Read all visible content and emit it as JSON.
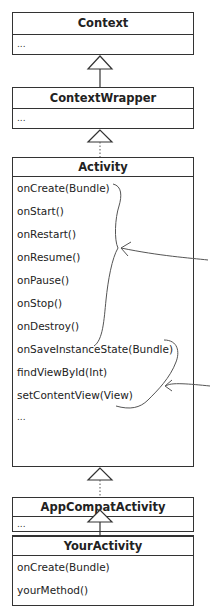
{
  "classes": [
    {
      "name": "Context",
      "members": [
        "..."
      ]
    },
    {
      "name": "ContextWrapper",
      "members": [
        "..."
      ]
    },
    {
      "name": "Activity",
      "members": [
        "onCreate(Bundle)",
        "onStart()",
        "onRestart()",
        "onResume()",
        "onPause()",
        "onStop()",
        "onDestroy()",
        "onSaveInstanceState(Bundle)",
        "findViewById(Int)",
        "setContentView(View)",
        "..."
      ]
    },
    {
      "name": "AppCompatActivity",
      "members": [
        "..."
      ]
    },
    {
      "name": "YourActivity",
      "members": [
        "onCreate(Bundle)",
        "yourMethod()"
      ]
    }
  ],
  "relations": [
    {
      "from": "ContextWrapper",
      "to": "Context",
      "type": "inheritance",
      "line": "solid"
    },
    {
      "from": "Activity",
      "to": "ContextWrapper",
      "type": "inheritance",
      "line": "dotted"
    },
    {
      "from": "AppCompatActivity",
      "to": "Activity",
      "type": "inheritance",
      "line": "dotted"
    },
    {
      "from": "YourActivity",
      "to": "AppCompatActivity",
      "type": "inheritance",
      "line": "solid"
    }
  ],
  "annotations": [
    {
      "group": "lifecycle-methods",
      "brace_over": [
        "onCreate(Bundle)",
        "onDestroy()"
      ]
    },
    {
      "group": "other-methods",
      "brace_over": [
        "onSaveInstanceState(Bundle)",
        "setContentView(View)"
      ]
    }
  ]
}
